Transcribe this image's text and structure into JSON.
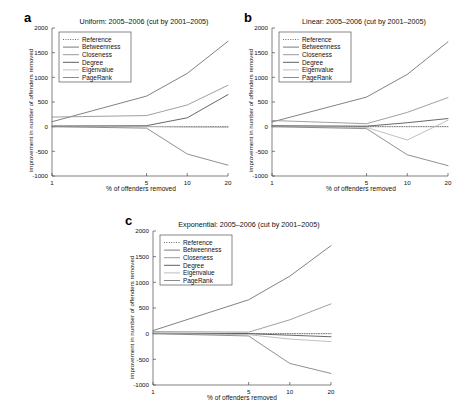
{
  "figure": {
    "xlabel": "% of offenders removed",
    "ylabel": "improvement in number of offenders removed",
    "yticks": [
      "-1000",
      "-500",
      "0",
      "500",
      "1000",
      "1500",
      "2000"
    ],
    "xticks": [
      "1",
      "5",
      "10",
      "20"
    ]
  },
  "panels": [
    {
      "letter": "a",
      "title": "Uniform: 2005–2006 (cut by 2001–2005)",
      "xlabel": "% of offenders removed",
      "ylabel": "improvement in number of offenders removed"
    },
    {
      "letter": "b",
      "title": "Linear: 2005–2006 (cut by 2001–2005)",
      "xlabel": "% of offenders removed",
      "ylabel": "improvement in number of offenders removed"
    },
    {
      "letter": "c",
      "title": "Exponential: 2005–2006 (cut by 2001–2005)",
      "xlabel": "% of offenders removed",
      "ylabel": "improvement in number of offenders removed"
    }
  ],
  "legend": {
    "items": [
      {
        "label": "Reference",
        "color": "#5a5a5a",
        "dash": "1,1.4"
      },
      {
        "label": "Betweenness",
        "color": "#6b6b6b",
        "dash": ""
      },
      {
        "label": "Closeness",
        "color": "#8f8f8f",
        "dash": ""
      },
      {
        "label": "Degree",
        "color": "#4d4d4d",
        "dash": ""
      },
      {
        "label": "Eigenvalue",
        "color": "#b5b5b5",
        "dash": ""
      },
      {
        "label": "PageRank",
        "color": "#7d7d7d",
        "dash": ""
      }
    ]
  },
  "chart_data": [
    {
      "type": "line",
      "title": "Uniform: 2005–2006 (cut by 2001–2005)",
      "panel": "a",
      "xlabel": "% of offenders removed",
      "ylabel": "improvement in number of offenders removed",
      "x": [
        1,
        5,
        10,
        20
      ],
      "xticklabels": [
        "1",
        "5",
        "10",
        "20"
      ],
      "xscale": "log",
      "ylim": [
        -1000,
        2000
      ],
      "yticks": [
        -1000,
        -500,
        0,
        500,
        1000,
        1500,
        2000
      ],
      "grid": false,
      "legend_position": "upper left",
      "series": [
        {
          "name": "Reference",
          "values": [
            0,
            0,
            0,
            0
          ]
        },
        {
          "name": "Betweenness",
          "values": [
            100,
            620,
            1080,
            1730
          ]
        },
        {
          "name": "Closeness",
          "values": [
            195,
            225,
            440,
            840
          ]
        },
        {
          "name": "Degree",
          "values": [
            15,
            20,
            180,
            650
          ]
        },
        {
          "name": "Eigenvalue",
          "values": [
            10,
            5,
            -10,
            -15
          ]
        },
        {
          "name": "PageRank",
          "values": [
            0,
            -30,
            -555,
            -780
          ]
        }
      ]
    },
    {
      "type": "line",
      "title": "Linear: 2005–2006 (cut by 2001–2005)",
      "panel": "b",
      "xlabel": "% of offenders removed",
      "ylabel": "improvement in number of offenders removed",
      "x": [
        1,
        5,
        10,
        20
      ],
      "xticklabels": [
        "1",
        "5",
        "10",
        "20"
      ],
      "xscale": "log",
      "ylim": [
        -1000,
        2000
      ],
      "yticks": [
        -1000,
        -500,
        0,
        500,
        1000,
        1500,
        2000
      ],
      "grid": false,
      "legend_position": "upper left",
      "series": [
        {
          "name": "Reference",
          "values": [
            0,
            0,
            0,
            0
          ]
        },
        {
          "name": "Betweenness",
          "values": [
            95,
            600,
            1060,
            1720
          ]
        },
        {
          "name": "Closeness",
          "values": [
            125,
            60,
            290,
            590
          ]
        },
        {
          "name": "Degree",
          "values": [
            20,
            10,
            80,
            165
          ]
        },
        {
          "name": "Eigenvalue",
          "values": [
            5,
            -15,
            -270,
            130
          ]
        },
        {
          "name": "PageRank",
          "values": [
            0,
            -40,
            -570,
            -790
          ]
        }
      ]
    },
    {
      "type": "line",
      "title": "Exponential: 2005–2006 (cut by 2001–2005)",
      "panel": "c",
      "xlabel": "% of offenders removed",
      "ylabel": "improvement in number of offenders removed",
      "x": [
        1,
        5,
        10,
        20
      ],
      "xticklabels": [
        "1",
        "5",
        "10",
        "20"
      ],
      "xscale": "log",
      "ylim": [
        -1000,
        2000
      ],
      "yticks": [
        -1000,
        -500,
        0,
        500,
        1000,
        1500,
        2000
      ],
      "grid": false,
      "legend_position": "upper left",
      "series": [
        {
          "name": "Reference",
          "values": [
            0,
            0,
            0,
            0
          ]
        },
        {
          "name": "Betweenness",
          "values": [
            60,
            660,
            1120,
            1715
          ]
        },
        {
          "name": "Closeness",
          "values": [
            40,
            30,
            270,
            580
          ]
        },
        {
          "name": "Degree",
          "values": [
            10,
            0,
            -30,
            -60
          ]
        },
        {
          "name": "Eigenvalue",
          "values": [
            5,
            -20,
            -105,
            -155
          ]
        },
        {
          "name": "PageRank",
          "values": [
            0,
            -45,
            -580,
            -775
          ]
        }
      ]
    }
  ]
}
